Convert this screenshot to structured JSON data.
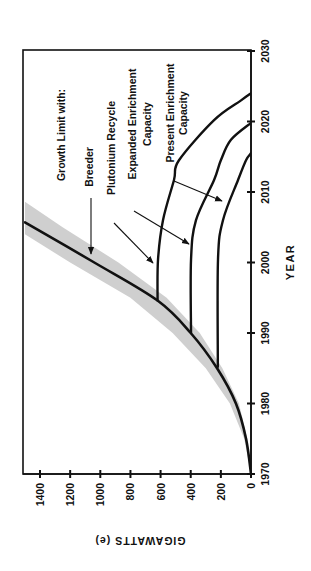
{
  "chart_data": {
    "type": "line",
    "title": "",
    "orientation": "rotated-90",
    "xlabel": "YEAR",
    "ylabel": "GIGAWATTS (e)",
    "xlim": [
      1970,
      2030
    ],
    "ylim": [
      0,
      1500
    ],
    "x_ticks": [
      1970,
      1980,
      1990,
      2000,
      2010,
      2020,
      2030
    ],
    "y_ticks": [
      0,
      200,
      400,
      600,
      800,
      1000,
      1200,
      1400
    ],
    "x_tick_labels": [
      "1970",
      "1980",
      "1990",
      "2000",
      "2010",
      "2020",
      "2030"
    ],
    "y_tick_labels": [
      "0",
      "200",
      "400",
      "600",
      "800",
      "1000",
      "1200",
      "1400"
    ],
    "grid": false,
    "legend_heading": "Growth Limit with:",
    "band": {
      "name": "uncertainty band around Breeder growth curve",
      "color": "#cfcfcf",
      "upper": [
        [
          1970,
          0
        ],
        [
          1975,
          45
        ],
        [
          1980,
          140
        ],
        [
          1985,
          300
        ],
        [
          1990,
          520
        ],
        [
          1995,
          800
        ],
        [
          2000,
          1200
        ],
        [
          2004,
          1500
        ]
      ],
      "lower": [
        [
          1970,
          0
        ],
        [
          1975,
          25
        ],
        [
          1980,
          80
        ],
        [
          1985,
          190
        ],
        [
          1990,
          340
        ],
        [
          1995,
          560
        ],
        [
          2000,
          880
        ],
        [
          2005,
          1250
        ],
        [
          2008.6,
          1500
        ]
      ]
    },
    "series": [
      {
        "name": "Breeder",
        "points": [
          [
            1970,
            0
          ],
          [
            1975,
            33
          ],
          [
            1980,
            100
          ],
          [
            1985,
            225
          ],
          [
            1990,
            400
          ],
          [
            1994.6,
            620
          ],
          [
            2000,
            1040
          ],
          [
            2005.7,
            1500
          ]
        ]
      },
      {
        "name": "Plutonium Recycle",
        "points": [
          [
            1994.6,
            620
          ],
          [
            2000.4,
            617
          ],
          [
            2006,
            584
          ],
          [
            2011.7,
            511
          ],
          [
            2014.5,
            478
          ],
          [
            2020.2,
            245
          ],
          [
            2023,
            66
          ],
          [
            2024,
            0
          ]
        ]
      },
      {
        "name": "Expanded Enrichment Capacity",
        "points": [
          [
            1990,
            398
          ],
          [
            2000.4,
            398
          ],
          [
            2006,
            365
          ],
          [
            2011.7,
            245
          ],
          [
            2014.5,
            200
          ],
          [
            2017.4,
            133
          ],
          [
            2019.8,
            0
          ]
        ]
      },
      {
        "name": "Present Enrichment Capacity",
        "points": [
          [
            1985.2,
            220
          ],
          [
            2000.4,
            219
          ],
          [
            2006,
            186
          ],
          [
            2011.7,
            86
          ],
          [
            2014.5,
            33
          ],
          [
            2015.5,
            0
          ]
        ]
      }
    ],
    "annotations": [
      {
        "text": "Growth Limit with:",
        "lines": [
          "Growth Limit with:"
        ]
      },
      {
        "text": "Breeder",
        "lines": [
          "Breeder"
        ],
        "arrow_to_series": "Breeder"
      },
      {
        "text": "Plutonium Recycle",
        "lines": [
          "Plutonium Recycle"
        ],
        "arrow_to_series": "Plutonium Recycle"
      },
      {
        "text": "Expanded Enrichment Capacity",
        "lines": [
          "Expanded Enrichment",
          "Capacity"
        ],
        "arrow_to_series": "Expanded Enrichment Capacity"
      },
      {
        "text": "Present Enrichment Capacity",
        "lines": [
          "Present Enrichment",
          "Capacity"
        ],
        "arrow_to_series": "Present Enrichment Capacity"
      }
    ]
  },
  "labels": {
    "heading": "Growth Limit with:",
    "breeder": "Breeder",
    "plutonium": "Plutonium Recycle",
    "expanded_1": "Expanded Enrichment",
    "expanded_2": "Capacity",
    "present_1": "Present Enrichment",
    "present_2": "Capacity",
    "xlabel": "YEAR",
    "ylabel": "GIGAWATTS (e)"
  }
}
